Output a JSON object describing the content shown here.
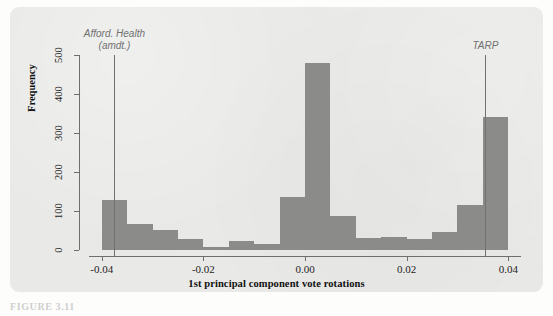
{
  "figure": {
    "caption": "FIGURE 3.11",
    "panel_background": "#e9e9e7",
    "bar_color": "#8b8b89",
    "axis_color": "#6e6e6c",
    "annotation_color": "#707070"
  },
  "chart_data": {
    "type": "bar",
    "title": "",
    "subtitle": "",
    "xlabel": "1st principal component vote rotations",
    "ylabel": "Frequency",
    "xlim": [
      -0.0425,
      0.0425
    ],
    "ylim": [
      0,
      500
    ],
    "grid": false,
    "legend_position": "none",
    "x_ticks": [
      -0.04,
      -0.02,
      0.0,
      0.02,
      0.04
    ],
    "x_tick_labels": [
      "-0.04",
      "-0.02",
      "0.00",
      "0.02",
      "0.04"
    ],
    "y_ticks": [
      0,
      100,
      200,
      300,
      400,
      500
    ],
    "y_tick_labels": [
      "0",
      "100",
      "200",
      "300",
      "400",
      "500"
    ],
    "bin_width": 0.005,
    "bin_edges": [
      -0.04,
      -0.035,
      -0.03,
      -0.025,
      -0.02,
      -0.015,
      -0.01,
      -0.005,
      0.0,
      0.005,
      0.01,
      0.015,
      0.02,
      0.025,
      0.03,
      0.035,
      0.04
    ],
    "bin_centers": [
      -0.0375,
      -0.0325,
      -0.0275,
      -0.0225,
      -0.0175,
      -0.0125,
      -0.0075,
      -0.0025,
      0.0025,
      0.0075,
      0.0125,
      0.0175,
      0.0225,
      0.0275,
      0.0325,
      0.0375
    ],
    "values": [
      128,
      66,
      52,
      29,
      7,
      22,
      16,
      137,
      480,
      86,
      32,
      34,
      27,
      45,
      115,
      340
    ],
    "categories": [
      "-0.0400 to -0.0350",
      "-0.0350 to -0.0300",
      "-0.0300 to -0.0250",
      "-0.0250 to -0.0200",
      "-0.0200 to -0.0150",
      "-0.0150 to -0.0100",
      "-0.0100 to -0.0050",
      "-0.0050 to 0.0000",
      "0.0000 to 0.0050",
      "0.0050 to 0.0100",
      "0.0100 to 0.0150",
      "0.0150 to 0.0200",
      "0.0200 to 0.0250",
      "0.0250 to 0.0300",
      "0.0300 to 0.0350",
      "0.0350 to 0.0400"
    ],
    "annotations": [
      {
        "label_line1": "Afford. Health",
        "label_line2": "(amdt.)",
        "x": -0.0375,
        "y_top": 500,
        "style": "vertical-rule"
      },
      {
        "label_line1": "TARP",
        "label_line2": "",
        "x": 0.0355,
        "y_top": 500,
        "style": "vertical-rule"
      }
    ]
  }
}
